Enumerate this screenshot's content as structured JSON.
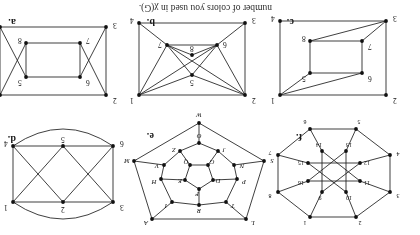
{
  "page": {
    "caption": "number of colors you used in χ(G).",
    "background": "#ffffff",
    "ink": "#1d1d1d",
    "orientation": "rotated-180",
    "panel_count": 6
  },
  "panels": {
    "a": {
      "tag": "a.",
      "vertex_labels": [
        "1",
        "2",
        "3",
        "4",
        "5",
        "6",
        "7",
        "8"
      ]
    },
    "b": {
      "tag": "b.",
      "vertex_labels": [
        "1",
        "2",
        "3",
        "4",
        "5",
        "6",
        "7",
        "8"
      ]
    },
    "c": {
      "tag": "c.",
      "vertex_labels": [
        "1",
        "2",
        "3",
        "4",
        "5",
        "6",
        "7",
        "8"
      ]
    },
    "d": {
      "tag": "d.",
      "vertex_labels": [
        "1",
        "2",
        "3",
        "4",
        "5",
        "6"
      ]
    },
    "e": {
      "tag": "e.",
      "vertex_labels": [
        "A",
        "L",
        "S",
        "M",
        "N",
        "V",
        "T",
        "H",
        "R",
        "P",
        "Q",
        "E",
        "J",
        "Z",
        "O",
        "D",
        "G",
        "F",
        "I",
        "W"
      ]
    },
    "f": {
      "tag": "f.",
      "vertex_labels": [
        "1",
        "2",
        "3",
        "4",
        "5",
        "6",
        "7",
        "8",
        "9",
        "10",
        "11",
        "12",
        "13",
        "14",
        "15",
        "16"
      ]
    }
  },
  "chart_data": {
    "type": "diagram",
    "graphs": [
      {
        "id": "a",
        "label": "a.",
        "vertices": [
          {
            "id": "1",
            "x": 118,
            "y": 12,
            "label": "1"
          },
          {
            "id": "2",
            "x": 12,
            "y": 12,
            "label": "2"
          },
          {
            "id": "3",
            "x": 12,
            "y": 80,
            "label": "3"
          },
          {
            "id": "4",
            "x": 118,
            "y": 80,
            "label": "4"
          },
          {
            "id": "5",
            "x": 92,
            "y": 30,
            "label": "5"
          },
          {
            "id": "6",
            "x": 38,
            "y": 30,
            "label": "6"
          },
          {
            "id": "7",
            "x": 38,
            "y": 64,
            "label": "7"
          },
          {
            "id": "8",
            "x": 92,
            "y": 64,
            "label": "8"
          }
        ],
        "edges": [
          [
            "1",
            "2"
          ],
          [
            "3",
            "4"
          ],
          [
            "2",
            "7"
          ],
          [
            "3",
            "6"
          ],
          [
            "6",
            "7"
          ],
          [
            "1",
            "8"
          ],
          [
            "4",
            "5"
          ],
          [
            "5",
            "8"
          ],
          [
            "5",
            "6"
          ],
          [
            "7",
            "8"
          ],
          [
            "2",
            "3"
          ],
          [
            "1",
            "4"
          ]
        ]
      },
      {
        "id": "b",
        "label": "b.",
        "vertices": [
          {
            "id": "1",
            "x": 118,
            "y": 12,
            "label": "1"
          },
          {
            "id": "2",
            "x": 12,
            "y": 12,
            "label": "2"
          },
          {
            "id": "3",
            "x": 12,
            "y": 84,
            "label": "3"
          },
          {
            "id": "4",
            "x": 118,
            "y": 84,
            "label": "4"
          },
          {
            "id": "5",
            "x": 65,
            "y": 32,
            "label": "5"
          },
          {
            "id": "6",
            "x": 40,
            "y": 62,
            "label": "6"
          },
          {
            "id": "7",
            "x": 90,
            "y": 62,
            "label": "7"
          },
          {
            "id": "8",
            "x": 65,
            "y": 52,
            "label": "8"
          }
        ],
        "edges": [
          [
            "1",
            "2"
          ],
          [
            "2",
            "3"
          ],
          [
            "3",
            "4"
          ],
          [
            "1",
            "4"
          ],
          [
            "2",
            "5"
          ],
          [
            "1",
            "5"
          ],
          [
            "5",
            "6"
          ],
          [
            "5",
            "7"
          ],
          [
            "2",
            "6"
          ],
          [
            "1",
            "7"
          ],
          [
            "3",
            "6"
          ],
          [
            "4",
            "7"
          ],
          [
            "6",
            "7"
          ],
          [
            "6",
            "8"
          ],
          [
            "7",
            "8"
          ],
          [
            "2",
            "7"
          ],
          [
            "1",
            "6"
          ]
        ]
      },
      {
        "id": "c",
        "label": "c.",
        "vertices": [
          {
            "id": "1",
            "x": 118,
            "y": 12,
            "label": "1"
          },
          {
            "id": "2",
            "x": 12,
            "y": 12,
            "label": "2"
          },
          {
            "id": "3",
            "x": 12,
            "y": 86,
            "label": "3"
          },
          {
            "id": "4",
            "x": 118,
            "y": 86,
            "label": "4"
          },
          {
            "id": "5",
            "x": 88,
            "y": 34,
            "label": "5"
          },
          {
            "id": "6",
            "x": 36,
            "y": 34,
            "label": "6"
          },
          {
            "id": "7",
            "x": 36,
            "y": 66,
            "label": "7"
          },
          {
            "id": "8",
            "x": 88,
            "y": 66,
            "label": "8"
          }
        ],
        "edges": [
          [
            "1",
            "2"
          ],
          [
            "2",
            "3"
          ],
          [
            "3",
            "4"
          ],
          [
            "1",
            "4"
          ],
          [
            "5",
            "6"
          ],
          [
            "6",
            "7"
          ],
          [
            "7",
            "8"
          ],
          [
            "5",
            "8"
          ],
          [
            "1",
            "5"
          ],
          [
            "1",
            "6"
          ],
          [
            "3",
            "7"
          ],
          [
            "3",
            "8"
          ]
        ]
      },
      {
        "id": "d",
        "label": "d.",
        "vertices": [
          {
            "id": "1",
            "x": 112,
            "y": 16,
            "label": "1"
          },
          {
            "id": "2",
            "x": 62,
            "y": 16,
            "label": "2"
          },
          {
            "id": "3",
            "x": 12,
            "y": 16,
            "label": "3"
          },
          {
            "id": "4",
            "x": 112,
            "y": 72,
            "label": "4"
          },
          {
            "id": "5",
            "x": 62,
            "y": 72,
            "label": "5"
          },
          {
            "id": "6",
            "x": 12,
            "y": 72,
            "label": "6"
          }
        ],
        "edges": [
          [
            "3",
            "2"
          ],
          [
            "2",
            "1"
          ],
          [
            "6",
            "5"
          ],
          [
            "5",
            "4"
          ],
          [
            "3",
            "6"
          ],
          [
            "1",
            "4"
          ],
          [
            "3",
            "5"
          ],
          [
            "2",
            "6"
          ],
          [
            "2",
            "4"
          ],
          [
            "1",
            "5"
          ]
        ],
        "arcs": [
          [
            "3",
            "1",
            "top"
          ],
          [
            "6",
            "4",
            "bottom"
          ]
        ]
      },
      {
        "id": "e",
        "label": "e.",
        "vertices": [
          {
            "id": "A",
            "x": 118,
            "y": 8,
            "label": "A"
          },
          {
            "id": "L",
            "x": 24,
            "y": 8,
            "label": "L"
          },
          {
            "id": "S",
            "x": 6,
            "y": 66,
            "label": "S"
          },
          {
            "id": "M",
            "x": 136,
            "y": 66,
            "label": "M"
          },
          {
            "id": "W",
            "x": 71,
            "y": 104,
            "label": "W"
          },
          {
            "id": "T",
            "x": 44,
            "y": 25,
            "label": "T"
          },
          {
            "id": "R",
            "x": 71,
            "y": 22,
            "label": "R"
          },
          {
            "id": "I",
            "x": 98,
            "y": 25,
            "label": "I"
          },
          {
            "id": "P",
            "x": 33,
            "y": 48,
            "label": "P"
          },
          {
            "id": "H",
            "x": 109,
            "y": 48,
            "label": "H"
          },
          {
            "id": "N",
            "x": 36,
            "y": 62,
            "label": "N"
          },
          {
            "id": "V",
            "x": 106,
            "y": 62,
            "label": "V"
          },
          {
            "id": "J",
            "x": 52,
            "y": 76,
            "label": "J"
          },
          {
            "id": "Z",
            "x": 90,
            "y": 76,
            "label": "Z"
          },
          {
            "id": "O",
            "x": 71,
            "y": 84,
            "label": "O"
          },
          {
            "id": "F",
            "x": 71,
            "y": 38,
            "label": "F"
          },
          {
            "id": "D",
            "x": 57,
            "y": 47,
            "label": "D"
          },
          {
            "id": "E",
            "x": 85,
            "y": 47,
            "label": "E"
          },
          {
            "id": "G",
            "x": 62,
            "y": 62,
            "label": "G"
          },
          {
            "id": "Q",
            "x": 80,
            "y": 62,
            "label": "Q"
          }
        ],
        "edges": [
          [
            "L",
            "A"
          ],
          [
            "L",
            "S"
          ],
          [
            "A",
            "M"
          ],
          [
            "S",
            "W"
          ],
          [
            "M",
            "W"
          ],
          [
            "L",
            "T"
          ],
          [
            "A",
            "I"
          ],
          [
            "S",
            "N"
          ],
          [
            "M",
            "V"
          ],
          [
            "W",
            "O"
          ],
          [
            "T",
            "R"
          ],
          [
            "R",
            "I"
          ],
          [
            "T",
            "P"
          ],
          [
            "I",
            "H"
          ],
          [
            "P",
            "N"
          ],
          [
            "H",
            "V"
          ],
          [
            "N",
            "J"
          ],
          [
            "V",
            "Z"
          ],
          [
            "J",
            "O"
          ],
          [
            "Z",
            "O"
          ],
          [
            "R",
            "F"
          ],
          [
            "P",
            "D"
          ],
          [
            "H",
            "E"
          ],
          [
            "J",
            "G"
          ],
          [
            "Z",
            "Q"
          ],
          [
            "F",
            "D"
          ],
          [
            "F",
            "E"
          ],
          [
            "D",
            "G"
          ],
          [
            "E",
            "Q"
          ],
          [
            "G",
            "Q"
          ]
        ]
      },
      {
        "id": "f",
        "label": "f.",
        "vertices": [
          {
            "id": "1",
            "x": 92,
            "y": 8,
            "label": "1"
          },
          {
            "id": "2",
            "x": 46,
            "y": 8,
            "label": "2"
          },
          {
            "id": "3",
            "x": 12,
            "y": 33,
            "label": "3"
          },
          {
            "id": "4",
            "x": 12,
            "y": 70,
            "label": "4"
          },
          {
            "id": "5",
            "x": 46,
            "y": 96,
            "label": "5"
          },
          {
            "id": "6",
            "x": 92,
            "y": 96,
            "label": "6"
          },
          {
            "id": "7",
            "x": 124,
            "y": 70,
            "label": "7"
          },
          {
            "id": "8",
            "x": 124,
            "y": 33,
            "label": "8"
          },
          {
            "id": "9",
            "x": 80,
            "y": 33,
            "label": "9"
          },
          {
            "id": "10",
            "x": 56,
            "y": 33,
            "label": "10"
          },
          {
            "id": "11",
            "x": 42,
            "y": 44,
            "label": "11"
          },
          {
            "id": "12",
            "x": 42,
            "y": 62,
            "label": "12"
          },
          {
            "id": "13",
            "x": 56,
            "y": 74,
            "label": "13"
          },
          {
            "id": "14",
            "x": 80,
            "y": 74,
            "label": "14"
          },
          {
            "id": "15",
            "x": 94,
            "y": 62,
            "label": "15"
          },
          {
            "id": "16",
            "x": 94,
            "y": 44,
            "label": "16"
          }
        ],
        "edges": [
          [
            "1",
            "2"
          ],
          [
            "2",
            "3"
          ],
          [
            "3",
            "4"
          ],
          [
            "4",
            "5"
          ],
          [
            "5",
            "6"
          ],
          [
            "6",
            "7"
          ],
          [
            "7",
            "8"
          ],
          [
            "8",
            "1"
          ],
          [
            "1",
            "9"
          ],
          [
            "2",
            "10"
          ],
          [
            "3",
            "11"
          ],
          [
            "4",
            "12"
          ],
          [
            "5",
            "13"
          ],
          [
            "6",
            "14"
          ],
          [
            "7",
            "15"
          ],
          [
            "8",
            "16"
          ],
          [
            "9",
            "12"
          ],
          [
            "10",
            "15"
          ],
          [
            "11",
            "14"
          ],
          [
            "13",
            "16"
          ],
          [
            "9",
            "14"
          ],
          [
            "10",
            "13"
          ],
          [
            "11",
            "16"
          ],
          [
            "12",
            "15"
          ]
        ]
      }
    ]
  }
}
